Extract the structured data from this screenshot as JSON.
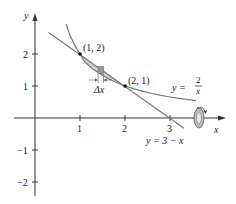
{
  "figure": {
    "type": "region-between-curves-revolved",
    "colors": {
      "axis": "#333333",
      "curve": "#7a7a7a",
      "line": "#7a7a7a",
      "region_fill": "#cfcfcf",
      "rectangle_fill": "#9a9a9a",
      "text": "#222222"
    },
    "axes": {
      "x_label": "x",
      "y_label": "y",
      "x_ticks": [
        "1",
        "2",
        "3"
      ],
      "y_ticks": [
        "2",
        "1",
        "−1",
        "−2"
      ]
    },
    "curves": {
      "hyperbola": {
        "equation_lhs": "y =",
        "numerator": "2",
        "denominator": "x"
      },
      "line": {
        "equation": "y = 3 − x"
      }
    },
    "points": [
      {
        "label": "(1, 2)"
      },
      {
        "label": "(2, 1)"
      }
    ],
    "delta_label": "Δx",
    "rotation_symbol": "revolve-about-x-axis"
  }
}
